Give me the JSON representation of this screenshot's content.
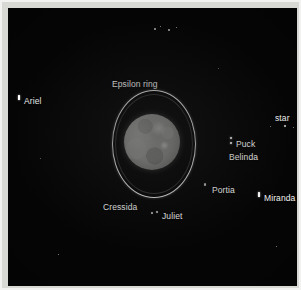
{
  "figure": {
    "background_color": "#050505",
    "frame_color": "#d8d8d4",
    "label_color": "#f4f4f2"
  },
  "planet": {
    "name": "Uranus disk",
    "center_x": 144,
    "center_y": 134,
    "radius": 28
  },
  "ring": {
    "label": "Epsilon ring",
    "center_x": 145,
    "center_y": 135,
    "semi_major": 53,
    "semi_minor": 41
  },
  "labels": [
    {
      "id": "epsilon-ring",
      "text": "Epsilon ring",
      "x": 104,
      "y": 71
    },
    {
      "id": "ariel",
      "text": "Ariel",
      "x": 16,
      "y": 88
    },
    {
      "id": "star",
      "text": "star",
      "x": 267,
      "y": 105
    },
    {
      "id": "puck",
      "text": "Puck",
      "x": 228,
      "y": 131
    },
    {
      "id": "belinda",
      "text": "Belinda",
      "x": 221,
      "y": 144
    },
    {
      "id": "portia",
      "text": "Portia",
      "x": 204,
      "y": 177
    },
    {
      "id": "miranda",
      "text": "Miranda",
      "x": 256,
      "y": 185
    },
    {
      "id": "cressida",
      "text": "Cressida",
      "x": 95,
      "y": 194
    },
    {
      "id": "juliet",
      "text": "Juliet",
      "x": 154,
      "y": 203
    }
  ],
  "markers": [
    {
      "id": "ariel-marker",
      "x": 10,
      "y": 87,
      "w": 2,
      "h": 5,
      "kind": "dash"
    },
    {
      "id": "puck-marker",
      "x": 222,
      "y": 129,
      "w": 2,
      "h": 2,
      "kind": "dot"
    },
    {
      "id": "belinda-marker",
      "x": 222,
      "y": 134,
      "w": 2,
      "h": 2,
      "kind": "dot"
    },
    {
      "id": "portia-marker",
      "x": 196,
      "y": 175,
      "w": 2,
      "h": 3,
      "kind": "faint"
    },
    {
      "id": "miranda-marker",
      "x": 250,
      "y": 184,
      "w": 2,
      "h": 5,
      "kind": "dash"
    },
    {
      "id": "juliet-marker",
      "x": 143,
      "y": 204,
      "w": 2,
      "h": 2,
      "kind": "faint"
    },
    {
      "id": "juliet-marker-2",
      "x": 148,
      "y": 203,
      "w": 2,
      "h": 2,
      "kind": "faint"
    },
    {
      "id": "star-marker",
      "x": 276,
      "y": 117,
      "w": 2,
      "h": 2,
      "kind": "faint"
    }
  ],
  "background_stars": [
    {
      "x": 146,
      "y": 20,
      "s": 1.5
    },
    {
      "x": 152,
      "y": 18,
      "s": 1.2
    },
    {
      "x": 160,
      "y": 21,
      "s": 1.6
    },
    {
      "x": 168,
      "y": 19,
      "s": 1.1
    },
    {
      "x": 262,
      "y": 118,
      "s": 1.2
    },
    {
      "x": 285,
      "y": 119,
      "s": 1.2
    },
    {
      "x": 50,
      "y": 246,
      "s": 1.1
    },
    {
      "x": 268,
      "y": 238,
      "s": 1.0
    },
    {
      "x": 32,
      "y": 150,
      "s": 0.9
    },
    {
      "x": 210,
      "y": 60,
      "s": 0.9
    }
  ]
}
